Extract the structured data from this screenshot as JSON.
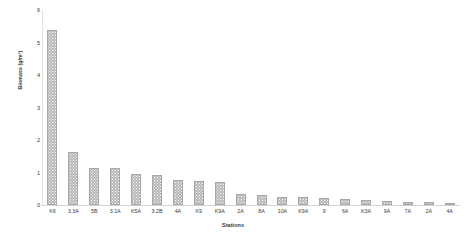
{
  "chart_data": {
    "type": "bar",
    "title": "",
    "xlabel": "Stations",
    "ylabel": "Biomass (g/m³)",
    "ylim": [
      0,
      6
    ],
    "yticks": [
      0,
      1,
      2,
      3,
      4,
      5,
      6
    ],
    "grid": false,
    "legend": null,
    "bar_color": "#b6b6b6",
    "bar_pattern": "dotted-stipple",
    "categories": [
      "K6",
      "3.3A",
      "5B",
      "3.1A",
      "K5A",
      "3.2B",
      "4A",
      "K9",
      "K9A",
      "2A",
      "8A",
      "10A",
      "K9A",
      "9",
      "6A",
      "K3A",
      "9A",
      "7A",
      "2A",
      "4A"
    ],
    "values": [
      5.38,
      1.63,
      1.15,
      1.15,
      0.95,
      0.93,
      0.78,
      0.73,
      0.72,
      0.35,
      0.3,
      0.24,
      0.24,
      0.21,
      0.17,
      0.16,
      0.13,
      0.1,
      0.08,
      0.06
    ]
  },
  "axis": {
    "y_title": "Biomass (g/m³)",
    "x_title": "Stations"
  }
}
